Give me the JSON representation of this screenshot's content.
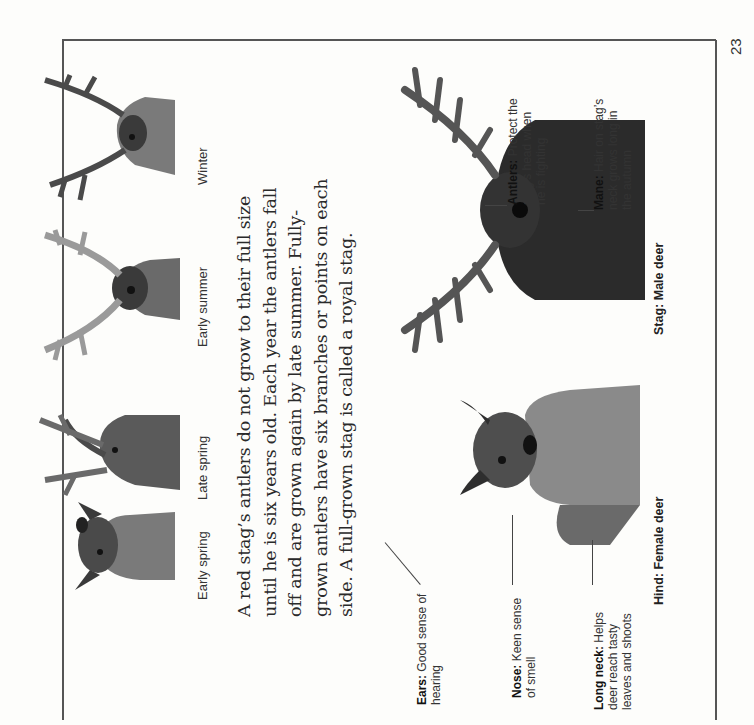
{
  "page": {
    "number": "23",
    "orientation": "rotated 90° counter-clockwise"
  },
  "seasons": [
    {
      "label": "Early spring"
    },
    {
      "label": "Late spring"
    },
    {
      "label": "Early summer"
    },
    {
      "label": "Winter"
    }
  ],
  "paragraph": {
    "lines": [
      "A red stag’s antlers do not grow to their full size",
      "until he is six years old. Each year the antlers fall",
      "off and are grown again by late summer. Fully-",
      "grown antlers have six branches or points on each",
      "side. A full-grown stag is called a royal stag."
    ]
  },
  "hind": {
    "caption": "Hind: Female deer",
    "labels": [
      {
        "term": "Ears:",
        "lines": [
          "Good sense of",
          "hearing"
        ]
      },
      {
        "term": "Nose:",
        "lines": [
          "Keen sense",
          "of smell"
        ]
      },
      {
        "term": "Long neck:",
        "lines": [
          "Helps",
          "deer reach tasty",
          "leaves and shoots"
        ]
      }
    ]
  },
  "stag": {
    "caption": "Stag: Male deer",
    "labels": [
      {
        "term": "Antlers:",
        "lines": [
          "Protect the",
          "stag’s head when",
          "he is fighting"
        ]
      },
      {
        "term": "Mane:",
        "lines": [
          "Hair on stag’s",
          "neck grows long in",
          "the autumn"
        ]
      }
    ]
  },
  "colors": {
    "background": "#fdfdfb",
    "text": "#222222",
    "frame": "#555555",
    "fur_dark": "#2b2b2b",
    "fur_mid": "#6b6b6b",
    "antler": "#5a5a5a"
  }
}
